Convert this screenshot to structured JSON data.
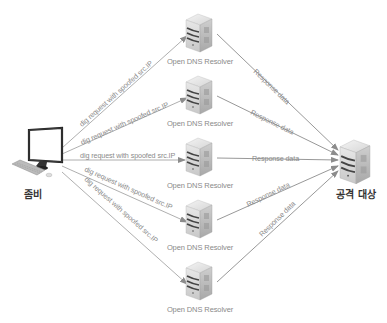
{
  "diagram": {
    "type": "dns-amplification-attack",
    "source": {
      "label": "좀비",
      "icon": "desktop-computer-icon"
    },
    "target": {
      "label": "공격 대상",
      "icon": "server-icon"
    },
    "resolvers": [
      {
        "label": "Open DNS Resolver",
        "request_label": "dig request with spoofed src.IP",
        "response_label": "Response data"
      },
      {
        "label": "Open DNS Resolver",
        "request_label": "dig request with spoofed src.IP",
        "response_label": "Response data"
      },
      {
        "label": "Open DNS Resolver",
        "request_label": "dig request with spoofed src.IP",
        "response_label": "Response data"
      },
      {
        "label": "Open DNS Resolver",
        "request_label": "dig request with spoofed src.IP",
        "response_label": "Response data"
      },
      {
        "label": "Open DNS Resolver",
        "request_label": "dig request with spoofed src.IP",
        "response_label": "Response data"
      }
    ],
    "colors": {
      "line": "#8c8c8c",
      "text": "#8a8a8a",
      "label_dark": "#333333"
    }
  }
}
